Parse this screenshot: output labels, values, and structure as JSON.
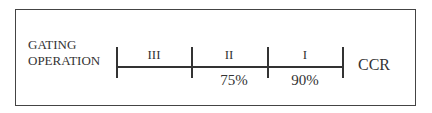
{
  "diagram": {
    "left_label_line1": "GATING",
    "left_label_line2": "OPERATION",
    "right_label": "CCR",
    "segments": [
      {
        "roman": "III"
      },
      {
        "roman": "II"
      },
      {
        "roman": "I"
      }
    ],
    "thresholds": [
      "75%",
      "90%"
    ],
    "colors": {
      "line": "#333333",
      "background": "#ffffff"
    }
  }
}
